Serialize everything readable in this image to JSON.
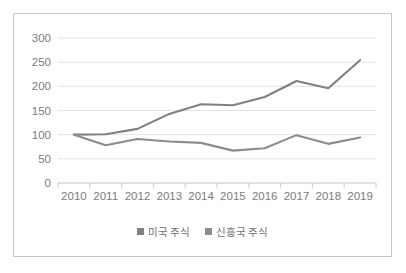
{
  "chart_data": {
    "type": "line",
    "title": "",
    "xlabel": "",
    "ylabel": "",
    "categories": [
      "2010",
      "2011",
      "2012",
      "2013",
      "2014",
      "2015",
      "2016",
      "2017",
      "2018",
      "2019"
    ],
    "series": [
      {
        "name": "미국 주식",
        "color": "#808080",
        "values": [
          100,
          101,
          112,
          143,
          163,
          161,
          178,
          211,
          196,
          254
        ]
      },
      {
        "name": "신흥국 주식",
        "color": "#8c8c8c",
        "values": [
          100,
          78,
          91,
          86,
          83,
          67,
          72,
          99,
          81,
          94
        ]
      }
    ],
    "ylim": [
      0,
      300
    ],
    "yticks": [
      0,
      50,
      100,
      150,
      200,
      250,
      300
    ],
    "ytick_labels": [
      "0",
      "50",
      "100",
      "150",
      "200",
      "250",
      "300"
    ],
    "grid": true,
    "legend_position": "bottom"
  },
  "legend": {
    "items": [
      {
        "label": "미국 주식",
        "color": "#808080"
      },
      {
        "label": "신흥국 주식",
        "color": "#8c8c8c"
      }
    ]
  },
  "colors": {
    "grid": "#dcdcdc",
    "axis": "#c0c0c0",
    "border": "#c8c8c8",
    "text": "#7b7b7b",
    "background": "#ffffff"
  }
}
